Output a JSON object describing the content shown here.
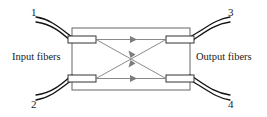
{
  "figure": {
    "kind": "fiber-optic-coupler-diagram",
    "background_color": "#ffffff"
  },
  "labels": {
    "input_fibers": "Input fibers",
    "output_fibers": "Output fibers",
    "port_1": "1",
    "port_2": "2",
    "port_3": "3",
    "port_4": "4"
  },
  "colors": {
    "fiber_stroke": "#111111",
    "box_stroke": "#555555",
    "ray_stroke": "#777777",
    "arrow_fill": "#777777",
    "text": "#1a1a1a"
  },
  "geometry": {
    "coupler_box": {
      "x": 72,
      "y": 28,
      "width": 118,
      "height": 62
    },
    "stubs": [
      {
        "name": "stub-top-left",
        "x": 68,
        "y": 36,
        "width": 28,
        "height": 7
      },
      {
        "name": "stub-bottom-left",
        "x": 68,
        "y": 75,
        "width": 28,
        "height": 7
      },
      {
        "name": "stub-top-right",
        "x": 166,
        "y": 36,
        "width": 28,
        "height": 7
      },
      {
        "name": "stub-bottom-right",
        "x": 166,
        "y": 75,
        "width": 28,
        "height": 7
      }
    ],
    "rays": [
      {
        "name": "ray-straight-top",
        "from": "port-1",
        "to": "port-3",
        "arrow_direction": "right"
      },
      {
        "name": "ray-straight-bottom",
        "from": "port-2",
        "to": "port-4",
        "arrow_direction": "right"
      },
      {
        "name": "ray-cross-down",
        "from": "port-1",
        "to": "port-4",
        "arrow_direction": "down-right"
      },
      {
        "name": "ray-cross-up",
        "from": "port-2",
        "to": "port-3",
        "arrow_direction": "up-right"
      }
    ]
  }
}
